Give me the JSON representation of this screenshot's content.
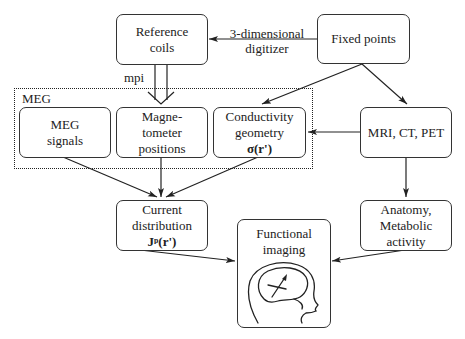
{
  "diagram": {
    "nodes": {
      "reference_coils": {
        "line1": "Reference",
        "line2": "coils"
      },
      "fixed_points": {
        "line1": "Fixed points"
      },
      "meg_group": {
        "label": "MEG"
      },
      "meg_signals": {
        "line1": "MEG",
        "line2": "signals"
      },
      "magnetometer_positions": {
        "line1": "Magne-",
        "line2": "tometer",
        "line3": "positions"
      },
      "conductivity": {
        "line1": "Conductivity",
        "line2": "geometry",
        "math": "σ(r')"
      },
      "mri_ct_pet": {
        "line1": "MRI, CT, PET"
      },
      "current_distribution": {
        "line1": "Current",
        "line2": "distribution",
        "math": "Jᵖ(r')"
      },
      "anatomy": {
        "line1": "Anatomy,",
        "line2": "Metabolic",
        "line3": "activity"
      },
      "functional_imaging": {
        "line1": "Functional",
        "line2": "imaging",
        "icon": "head-with-dipole-icon"
      }
    },
    "edge_labels": {
      "digitizer_line1": "3-dimensional",
      "digitizer_line2": "digitizer",
      "mpi": "mpi"
    },
    "edges": [
      {
        "from": "fixed_points",
        "to": "reference_coils",
        "label": "3-dimensional digitizer"
      },
      {
        "from": "reference_coils",
        "to": "magnetometer_positions",
        "label": "mpi",
        "style": "double"
      },
      {
        "from": "fixed_points",
        "to": "conductivity"
      },
      {
        "from": "fixed_points",
        "to": "mri_ct_pet"
      },
      {
        "from": "mri_ct_pet",
        "to": "conductivity"
      },
      {
        "from": "mri_ct_pet",
        "to": "anatomy"
      },
      {
        "from": "meg_signals",
        "to": "current_distribution"
      },
      {
        "from": "magnetometer_positions",
        "to": "current_distribution"
      },
      {
        "from": "conductivity",
        "to": "current_distribution"
      },
      {
        "from": "current_distribution",
        "to": "functional_imaging"
      },
      {
        "from": "anatomy",
        "to": "functional_imaging"
      }
    ]
  }
}
